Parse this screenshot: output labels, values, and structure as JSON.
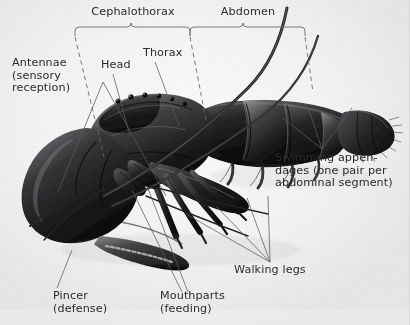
{
  "figure": {
    "background_color": "#ffffff",
    "text_color": "#2b2b2b",
    "line_color": "#55565a",
    "specimen_color": "#1e1e1e"
  },
  "brackets": [
    {
      "label": "Cephalothorax"
    },
    {
      "label": "Abdomen"
    }
  ],
  "labels": {
    "antennae": "Antennae\n(sensory\nreception)",
    "head": "Head",
    "thorax": "Thorax",
    "swimming_appendages": "Swimming appen-\ndages (one pair per\nabdominal segment)",
    "walking_legs": "Walking legs",
    "pincer": "Pincer\n(defense)",
    "mouthparts": "Mouthparts\n(feeding)"
  }
}
